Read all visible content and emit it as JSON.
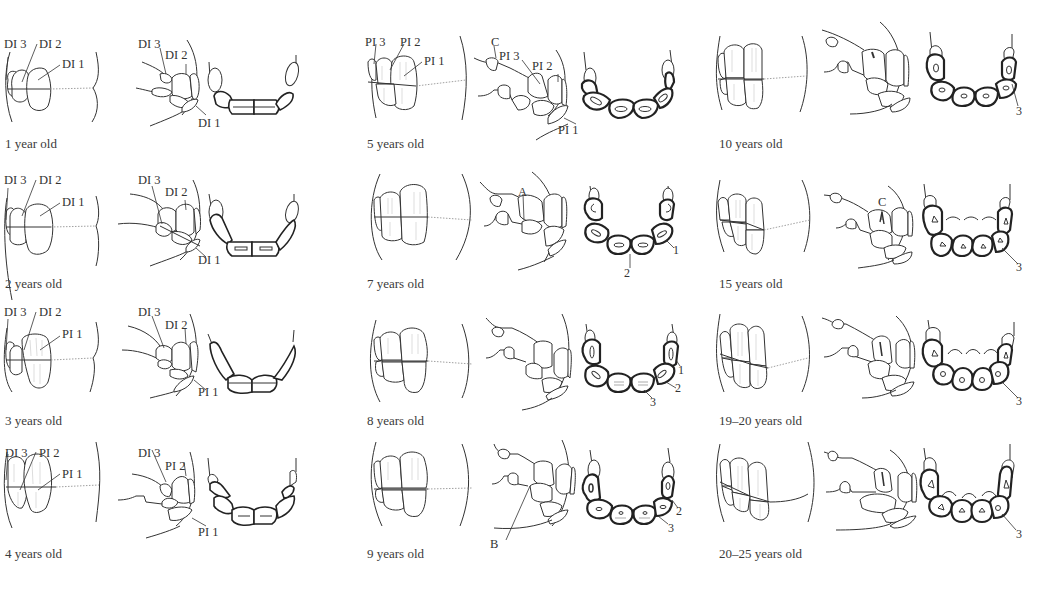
{
  "figure": {
    "panels": [
      {
        "id": "p1",
        "age": "1 year old",
        "labels": {
          "front": [
            "DI 3",
            "DI 2",
            "DI 1"
          ],
          "side": [
            "DI 3",
            "DI 2",
            "DI 1"
          ],
          "arch": []
        }
      },
      {
        "id": "p2",
        "age": "2 years old",
        "labels": {
          "front": [
            "DI 3",
            "DI 2",
            "DI 1"
          ],
          "side": [
            "DI 3",
            "DI 2",
            "DI 1"
          ],
          "arch": []
        }
      },
      {
        "id": "p3",
        "age": "3 years old",
        "labels": {
          "front": [
            "DI 3",
            "DI 2",
            "PI 1"
          ],
          "side": [
            "DI 3",
            "DI 2",
            "PI 1"
          ],
          "arch": []
        }
      },
      {
        "id": "p4",
        "age": "4 years old",
        "labels": {
          "front": [
            "DI 3",
            "PI 2",
            "PI 1"
          ],
          "side": [
            "DI 3",
            "PI 2",
            "PI 1"
          ],
          "arch": []
        }
      },
      {
        "id": "p5",
        "age": "5 years old",
        "labels": {
          "front": [
            "PI 3",
            "PI 2",
            "PI 1"
          ],
          "side": [
            "C",
            "PI 3",
            "PI 2",
            "PI 1"
          ],
          "arch": []
        }
      },
      {
        "id": "p6",
        "age": "7 years old",
        "labels": {
          "front": [],
          "side": [
            "A"
          ],
          "arch": [
            "1",
            "2"
          ]
        }
      },
      {
        "id": "p7",
        "age": "8 years old",
        "labels": {
          "front": [],
          "side": [],
          "arch": [
            "1",
            "2",
            "3"
          ]
        }
      },
      {
        "id": "p8",
        "age": "9 years old",
        "labels": {
          "front": [],
          "side": [
            "B"
          ],
          "arch": [
            "2",
            "3"
          ]
        }
      },
      {
        "id": "p9",
        "age": "10 years old",
        "labels": {
          "front": [],
          "side": [],
          "arch": [
            "3"
          ]
        }
      },
      {
        "id": "p10",
        "age": "15 years old",
        "labels": {
          "front": [],
          "side": [
            "C"
          ],
          "arch": [
            "3"
          ]
        }
      },
      {
        "id": "p11",
        "age": "19–20 years old",
        "labels": {
          "front": [],
          "side": [],
          "arch": [
            "3"
          ]
        }
      },
      {
        "id": "p12",
        "age": "20–25 years old",
        "labels": {
          "front": [],
          "side": [],
          "arch": [
            "3"
          ]
        }
      }
    ]
  },
  "colors": {
    "line": "#333333",
    "background": "#ffffff",
    "caption": "#3a3a3a"
  }
}
